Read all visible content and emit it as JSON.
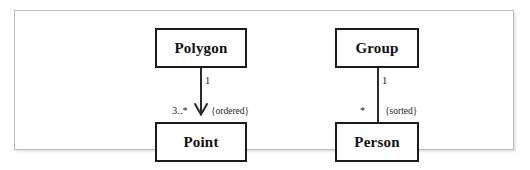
{
  "diagram": {
    "type": "uml-class-diagram",
    "background_color": "#ffffff",
    "frame_border_color": "#b9b9b9",
    "box_border_color": "#1a1a1a",
    "line_color": "#2a2a2a",
    "text_color": "#111111",
    "classes": [
      {
        "id": "polygon",
        "name": "Polygon"
      },
      {
        "id": "point",
        "name": "Point"
      },
      {
        "id": "group",
        "name": "Group"
      },
      {
        "id": "person",
        "name": "Person"
      }
    ],
    "associations": [
      {
        "id": "polygon-point",
        "from": "Polygon",
        "to": "Point",
        "source_multiplicity": "1",
        "target_multiplicity": "3..*",
        "constraint": "{ordered}",
        "arrowhead": "open-v",
        "navigable": true
      },
      {
        "id": "group-person",
        "from": "Group",
        "to": "Person",
        "source_multiplicity": "1",
        "target_multiplicity": "*",
        "constraint": "{sorted}",
        "arrowhead": "none",
        "navigable": false
      }
    ]
  }
}
